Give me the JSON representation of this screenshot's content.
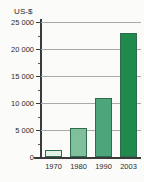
{
  "chart_data": {
    "type": "bar",
    "title": "",
    "subtitle": "",
    "xlabel": "",
    "ylabel": "US-$",
    "unit_label": "US-$",
    "categories": [
      "1970",
      "1980",
      "1990",
      "2003"
    ],
    "values": [
      1300,
      5400,
      11000,
      23000
    ],
    "series": [
      {
        "name": "US-$",
        "values": [
          1300,
          5400,
          11000,
          23000
        ]
      }
    ],
    "ylim": [
      0,
      25000
    ],
    "ytick_labels": [
      "0",
      "5 000",
      "10 000",
      "15 000",
      "20 000",
      "25 000"
    ],
    "ytick_values": [
      0,
      5000,
      10000,
      15000,
      20000,
      25000
    ],
    "minor_tick_values": [
      2500,
      7500,
      12500,
      17500,
      22500
    ],
    "grid": true,
    "grid_axis": "y",
    "legend": "none",
    "bar_colors": [
      "#e3f0e6",
      "#7fbf9a",
      "#4da57c",
      "#1f8a4c"
    ],
    "bar_border_color": "#2f6b4f",
    "gridline_color": "#a9a9a9",
    "axis_color": "#3a3a3a",
    "background_color": "#fbfbf9",
    "text_color": "#2b2b2b"
  }
}
